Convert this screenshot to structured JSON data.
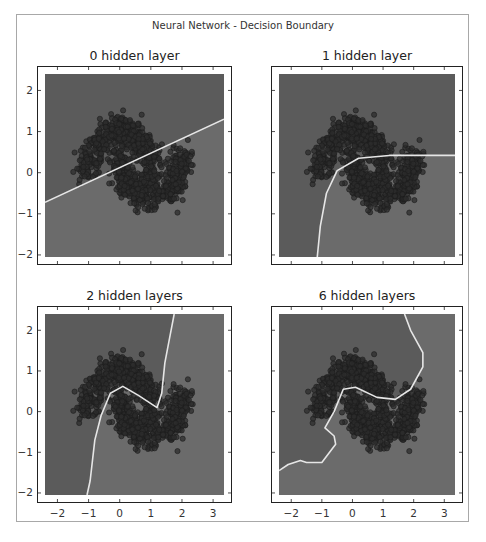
{
  "figure": {
    "title": "Neural Network - Decision Boundary",
    "colors": {
      "class0_region": "#5b5b5b",
      "class1_region": "#6b6b6b",
      "points": "#2c2c2c",
      "point_edge": "#1c1c1c",
      "boundary": "#e6e6e6",
      "axes": "#222222"
    }
  },
  "chart_data": [
    {
      "type": "scatter",
      "title": "0 hidden layer",
      "xlabel": "",
      "ylabel": "",
      "xlim": [
        -2.4,
        3.35
      ],
      "ylim": [
        -2.05,
        2.4
      ],
      "xticks": [
        -2,
        -1,
        0,
        1,
        2,
        3
      ],
      "yticks": [
        2,
        1,
        0,
        -1,
        -2
      ],
      "show_xticklabels": false,
      "show_yticklabels": true,
      "grid": false,
      "dataset": "two interleaving half-moons (~1000 points, noisy)",
      "decision_boundary": [
        [
          -2.4,
          -0.72
        ],
        [
          3.35,
          1.3
        ]
      ],
      "regions": {
        "upper_left": "class 0 (darker)",
        "lower_right": "class 1 (lighter)"
      }
    },
    {
      "type": "scatter",
      "title": "1 hidden layer",
      "xlabel": "",
      "ylabel": "",
      "xlim": [
        -2.4,
        3.35
      ],
      "ylim": [
        -2.05,
        2.4
      ],
      "xticks": [
        -2,
        -1,
        0,
        1,
        2,
        3
      ],
      "yticks": [
        2,
        1,
        0,
        -1,
        -2
      ],
      "show_xticklabels": false,
      "show_yticklabels": false,
      "grid": false,
      "dataset": "two interleaving half-moons (~1000 points, noisy)",
      "decision_boundary": [
        [
          -1.15,
          -2.05
        ],
        [
          -1.05,
          -1.3
        ],
        [
          -0.85,
          -0.5
        ],
        [
          -0.5,
          0.05
        ],
        [
          0.2,
          0.35
        ],
        [
          1.2,
          0.42
        ],
        [
          3.35,
          0.42
        ]
      ],
      "regions": {
        "upper_left": "class 0 (darker)",
        "lower_right": "class 1 (lighter)"
      }
    },
    {
      "type": "scatter",
      "title": "2 hidden layers",
      "xlabel": "",
      "ylabel": "",
      "xlim": [
        -2.4,
        3.35
      ],
      "ylim": [
        -2.05,
        2.4
      ],
      "xticks": [
        -2,
        -1,
        0,
        1,
        2,
        3
      ],
      "yticks": [
        2,
        1,
        0,
        -1,
        -2
      ],
      "show_xticklabels": true,
      "show_yticklabels": true,
      "grid": false,
      "dataset": "two interleaving half-moons (~1000 points, noisy)",
      "decision_boundary": [
        [
          -1.05,
          -2.05
        ],
        [
          -0.95,
          -1.7
        ],
        [
          -0.8,
          -0.7
        ],
        [
          -0.6,
          -0.1
        ],
        [
          -0.3,
          0.45
        ],
        [
          0.1,
          0.62
        ],
        [
          0.6,
          0.4
        ],
        [
          1.2,
          0.1
        ],
        [
          1.35,
          0.45
        ],
        [
          1.45,
          1.2
        ],
        [
          1.6,
          1.8
        ],
        [
          1.75,
          2.4
        ]
      ],
      "regions": {
        "left": "class 0 (darker)",
        "right": "class 1 (lighter)"
      }
    },
    {
      "type": "scatter",
      "title": "6 hidden layers",
      "xlabel": "",
      "ylabel": "",
      "xlim": [
        -2.4,
        3.35
      ],
      "ylim": [
        -2.05,
        2.4
      ],
      "xticks": [
        -2,
        -1,
        0,
        1,
        2,
        3
      ],
      "yticks": [
        2,
        1,
        0,
        -1,
        -2
      ],
      "show_xticklabels": true,
      "show_yticklabels": false,
      "grid": false,
      "dataset": "two interleaving half-moons (~1000 points, noisy)",
      "decision_boundary": [
        [
          -2.4,
          -1.45
        ],
        [
          -2.1,
          -1.3
        ],
        [
          -1.7,
          -1.2
        ],
        [
          -1.5,
          -1.25
        ],
        [
          -1.0,
          -1.25
        ],
        [
          -0.55,
          -0.8
        ],
        [
          -0.6,
          -0.6
        ],
        [
          -0.9,
          -0.4
        ],
        [
          -0.6,
          0.0
        ],
        [
          -0.3,
          0.55
        ],
        [
          0.1,
          0.6
        ],
        [
          0.8,
          0.35
        ],
        [
          1.4,
          0.3
        ],
        [
          1.9,
          0.55
        ],
        [
          2.3,
          1.1
        ],
        [
          2.3,
          1.45
        ],
        [
          1.9,
          2.0
        ],
        [
          1.7,
          2.4
        ]
      ],
      "regions": {
        "upper_left": "class 0 (darker)",
        "lower_right": "class 1 (lighter)"
      }
    }
  ]
}
